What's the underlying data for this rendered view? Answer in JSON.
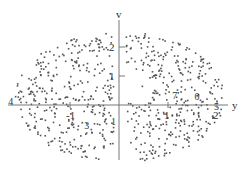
{
  "chart_data": {
    "type": "scatter",
    "title": "",
    "xlabel": "y",
    "ylabel": "v",
    "xlim": [
      -2.3,
      2.2
    ],
    "ylim": [
      -2.0,
      2.9
    ],
    "x_ticks": [
      -1,
      1,
      2
    ],
    "y_ticks": [
      1,
      2
    ],
    "x_tick_labels": [
      "-1",
      "1",
      "2"
    ],
    "y_tick_labels": [
      "1",
      "2"
    ],
    "grid": false,
    "legend": null,
    "point_count_approx": 700,
    "annotations": [
      {
        "text": "4",
        "y": -2.2,
        "v": 0.15
      },
      {
        "text": "7",
        "y": 1.15,
        "v": 0.35
      },
      {
        "text": "0",
        "y": 1.6,
        "v": 0.3
      },
      {
        "text": "5",
        "y": 2.0,
        "v": -0.05
      },
      {
        "text": "3",
        "y": -0.65,
        "v": -0.7
      },
      {
        "text": "1",
        "y": -0.1,
        "v": -0.55
      }
    ],
    "point_color": "#555555",
    "axis_color": "#777777"
  },
  "layout": {
    "origin_px": [
      119,
      105
    ],
    "unit_px_x": 49,
    "unit_px_y": 29
  }
}
